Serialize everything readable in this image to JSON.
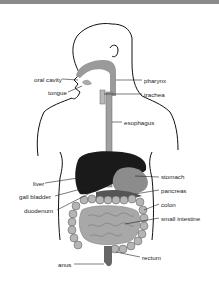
{
  "diagram": {
    "labels_left": [
      {
        "id": "oral-cavity",
        "text": "oral cavity",
        "x": 34,
        "y": 77
      },
      {
        "id": "tongue",
        "text": "tongue",
        "x": 48,
        "y": 90
      },
      {
        "id": "liver",
        "text": "liver",
        "x": 33,
        "y": 181
      },
      {
        "id": "gall-bladder",
        "text": "gall bladder",
        "x": 19,
        "y": 194
      },
      {
        "id": "duodenum",
        "text": "duodenum",
        "x": 24,
        "y": 208
      },
      {
        "id": "anus",
        "text": "anus",
        "x": 58,
        "y": 262
      }
    ],
    "labels_right": [
      {
        "id": "pharynx",
        "text": "pharynx",
        "x": 144,
        "y": 77
      },
      {
        "id": "trachea",
        "text": "trachea",
        "x": 144,
        "y": 91
      },
      {
        "id": "esophagus",
        "text": "esophagus",
        "x": 124,
        "y": 119
      },
      {
        "id": "stomach",
        "text": "stomach",
        "x": 161,
        "y": 174
      },
      {
        "id": "pancreas",
        "text": "pancreas",
        "x": 161,
        "y": 187
      },
      {
        "id": "colon",
        "text": "colon",
        "x": 161,
        "y": 201
      },
      {
        "id": "small-intestine",
        "text": "small intestine",
        "x": 161,
        "y": 215
      },
      {
        "id": "rectum",
        "text": "rectum",
        "x": 142,
        "y": 255
      }
    ]
  }
}
